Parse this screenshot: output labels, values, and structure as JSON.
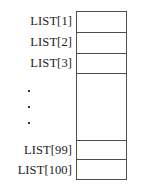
{
  "figure": {
    "type": "array-list-diagram",
    "background_color": "#ffffff",
    "line_color": "#4d4d4d",
    "text_color": "#1c1c1c"
  },
  "labels": [
    {
      "text": "LIST[1]"
    },
    {
      "text": "LIST[2]"
    },
    {
      "text": "LIST[3]"
    },
    {
      "text": "LIST[99]"
    },
    {
      "text": "LIST[100]"
    }
  ],
  "ellipsis": {
    "symbol": "·",
    "count": 3
  },
  "cells": [
    {
      "label": "LIST[1]",
      "value": ""
    },
    {
      "label": "LIST[2]",
      "value": ""
    },
    {
      "label": "LIST[3]",
      "value": ""
    },
    {
      "label": "elided",
      "value": ""
    },
    {
      "label": "LIST[99]",
      "value": ""
    },
    {
      "label": "LIST[100]",
      "value": ""
    }
  ]
}
